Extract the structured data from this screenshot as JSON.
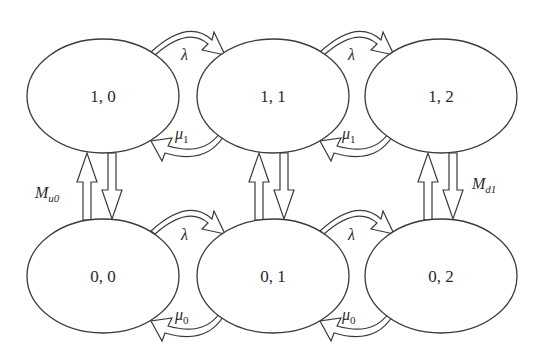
{
  "diagram": {
    "type": "state-transition-diagram",
    "states": [
      {
        "id": "s10",
        "label": "1, 0",
        "row": 0,
        "col": 0
      },
      {
        "id": "s11",
        "label": "1, 1",
        "row": 0,
        "col": 1
      },
      {
        "id": "s12",
        "label": "1, 2",
        "row": 0,
        "col": 2
      },
      {
        "id": "s00",
        "label": "0, 0",
        "row": 1,
        "col": 0
      },
      {
        "id": "s01",
        "label": "0, 1",
        "row": 1,
        "col": 1
      },
      {
        "id": "s02",
        "label": "0, 2",
        "row": 1,
        "col": 2
      }
    ],
    "transitions": [
      {
        "from": "1, 0",
        "to": "1, 1",
        "rate": "λ"
      },
      {
        "from": "1, 1",
        "to": "1, 0",
        "rate": "μ1"
      },
      {
        "from": "1, 1",
        "to": "1, 2",
        "rate": "λ"
      },
      {
        "from": "1, 2",
        "to": "1, 1",
        "rate": "μ1"
      },
      {
        "from": "0, 0",
        "to": "0, 1",
        "rate": "λ"
      },
      {
        "from": "0, 1",
        "to": "0, 0",
        "rate": "μ0"
      },
      {
        "from": "0, 1",
        "to": "0, 2",
        "rate": "λ"
      },
      {
        "from": "0, 2",
        "to": "0, 1",
        "rate": "μ0"
      },
      {
        "from": "0, 0",
        "to": "1, 0",
        "rate": "Mu0"
      },
      {
        "from": "1, 0",
        "to": "0, 0",
        "rate": ""
      },
      {
        "from": "0, 1",
        "to": "1, 1",
        "rate": ""
      },
      {
        "from": "1, 1",
        "to": "0, 1",
        "rate": ""
      },
      {
        "from": "0, 2",
        "to": "1, 2",
        "rate": ""
      },
      {
        "from": "1, 2",
        "to": "0, 2",
        "rate": "Md1"
      }
    ],
    "labels": {
      "lambda": "λ",
      "mu": "μ",
      "mu1_sub": "1",
      "mu0_sub": "0",
      "M": "M",
      "mu0_vertical_sub": "u0",
      "md1_vertical_sub": "d1"
    },
    "colors": {
      "stroke": "#3a3a3a",
      "fill": "#ffffff",
      "text": "#2a2a2a"
    }
  }
}
